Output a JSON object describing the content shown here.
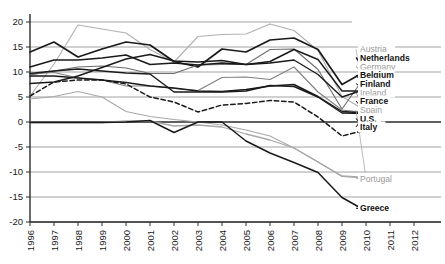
{
  "chart_data": {
    "type": "line",
    "title": "",
    "xlabel": "",
    "ylabel": "",
    "xlim": [
      1996,
      2012
    ],
    "ylim": [
      -20,
      20
    ],
    "ytick_labels": [
      "20",
      "15",
      "10",
      "5",
      "0",
      "-5",
      "-10",
      "-15",
      "-20"
    ],
    "ytick_values": [
      20,
      15,
      10,
      5,
      0,
      -5,
      -10,
      -15,
      -20
    ],
    "xtick_labels": [
      "1996",
      "1997",
      "1998",
      "1999",
      "2000",
      "2001",
      "2002",
      "2003",
      "2004",
      "2005",
      "2006",
      "2007",
      "2008",
      "2009",
      "2010",
      "2011",
      "2012"
    ],
    "xtick_values": [
      1996,
      1997,
      1998,
      1999,
      2000,
      2001,
      2002,
      2003,
      2004,
      2005,
      2006,
      2007,
      2008,
      2009,
      2010,
      2011,
      2012
    ],
    "grid": true,
    "legend_position": "right",
    "x": [
      1996,
      1997,
      1998,
      1999,
      2000,
      2001,
      2002,
      2003,
      2004,
      2005,
      2006,
      2007,
      2008,
      2009,
      2010
    ],
    "series": [
      {
        "name": "Austria",
        "label": "Austria",
        "color": "#b0b0b0",
        "style": "solid",
        "width": 1.1,
        "legend_y": 14.6,
        "values": [
          5.2,
          11.6,
          19.4,
          18.6,
          17.8,
          14.5,
          12.0,
          17.1,
          17.5,
          17.6,
          19.6,
          18.3,
          14.3,
          5.1,
          2.2
        ]
      },
      {
        "name": "Netherlands",
        "label": "Netherlands",
        "color": "#1a1a1a",
        "style": "solid",
        "width": 1.7,
        "legend_y": 12.9,
        "values": [
          14.0,
          16.0,
          13.0,
          14.6,
          16.0,
          15.4,
          12.1,
          11.0,
          14.6,
          14.0,
          16.4,
          16.8,
          14.5,
          7.5,
          10.2
        ]
      },
      {
        "name": "Germany",
        "label": "Germany",
        "color": "#6e6e6e",
        "style": "solid",
        "width": 1.1,
        "legend_y": 11.1,
        "values": [
          9.4,
          10.2,
          11.0,
          11.2,
          10.8,
          9.7,
          9.7,
          11.4,
          11.5,
          11.5,
          14.5,
          14.6,
          10.5,
          2.6,
          9.4
        ]
      },
      {
        "name": "Belgium",
        "label": "Belgium",
        "color": "#1a1a1a",
        "style": "solid",
        "width": 1.4,
        "legend_y": 9.4,
        "values": [
          11.0,
          12.4,
          12.4,
          12.8,
          13.4,
          11.5,
          11.8,
          11.4,
          11.8,
          11.5,
          11.8,
          12.4,
          9.5,
          5.0,
          6.6
        ]
      },
      {
        "name": "Finland",
        "label": "Finland",
        "color": "#1a1a1a",
        "style": "solid",
        "width": 1.4,
        "legend_y": 7.7,
        "values": [
          7.7,
          8.0,
          9.2,
          10.9,
          12.6,
          13.5,
          12.2,
          12.0,
          12.3,
          11.5,
          12.1,
          14.5,
          12.5,
          6.2,
          6.2
        ]
      },
      {
        "name": "Ireland",
        "label": "Ireland",
        "color": "#808080",
        "style": "solid",
        "width": 1.1,
        "legend_y": 5.9,
        "values": [
          9.6,
          9.9,
          8.8,
          8.4,
          7.2,
          7.2,
          6.7,
          6.3,
          8.9,
          9.0,
          8.5,
          11.0,
          6.0,
          2.4,
          1.9
        ]
      },
      {
        "name": "France",
        "label": "France",
        "color": "#1a1a1a",
        "style": "solid",
        "width": 1.4,
        "legend_y": 4.2,
        "values": [
          9.2,
          9.2,
          8.8,
          8.4,
          7.9,
          7.2,
          6.8,
          6.2,
          6.1,
          6.5,
          7.2,
          7.5,
          5.1,
          2.1,
          1.8
        ]
      },
      {
        "name": "Spain",
        "label": "Spain",
        "color": "#a8a8a8",
        "style": "solid",
        "width": 1.1,
        "legend_y": 2.4,
        "values": [
          4.6,
          5.1,
          6.1,
          5.0,
          2.1,
          1.1,
          0.5,
          0.0,
          -0.6,
          -1.6,
          -2.8,
          -5.2,
          -8.0,
          -10.9,
          -11.2
        ]
      },
      {
        "name": "U.S.",
        "label": "U.S.",
        "color": "#1a1a1a",
        "style": "dashed",
        "width": 1.5,
        "legend_y": 0.7,
        "values": [
          5.2,
          8.0,
          8.4,
          8.4,
          7.6,
          5.0,
          4.0,
          2.0,
          3.4,
          3.7,
          4.3,
          4.0,
          1.0,
          -2.8,
          -1.6
        ]
      },
      {
        "name": "Italy",
        "label": "Italy",
        "color": "#1a1a1a",
        "style": "solid",
        "width": 1.4,
        "legend_y": -1.0,
        "values": [
          9.7,
          10.2,
          10.6,
          10.2,
          9.8,
          9.6,
          6.0,
          6.0,
          6.0,
          6.2,
          7.3,
          7.1,
          5.0,
          1.8,
          1.7
        ]
      },
      {
        "name": "Portugal",
        "label": "Portugal",
        "color": "#a8a8a8",
        "style": "solid",
        "width": 1.3,
        "legend_y": -11.3,
        "values": [
          -0.1,
          -0.1,
          -0.1,
          -0.1,
          0.2,
          0.2,
          -0.8,
          -0.6,
          -1.0,
          -2.4,
          -3.6,
          -5.2,
          -8.0,
          -10.8,
          -11.1
        ]
      },
      {
        "name": "Greece",
        "label": "Greece",
        "color": "#1a1a1a",
        "style": "solid",
        "width": 1.5,
        "legend_y": -17.2,
        "values": [
          -0.1,
          -0.1,
          -0.1,
          -0.1,
          0.0,
          0.3,
          -2.1,
          0.0,
          0.0,
          -3.8,
          -6.2,
          -8.1,
          -10.1,
          -15.1,
          -17.8
        ]
      }
    ]
  }
}
